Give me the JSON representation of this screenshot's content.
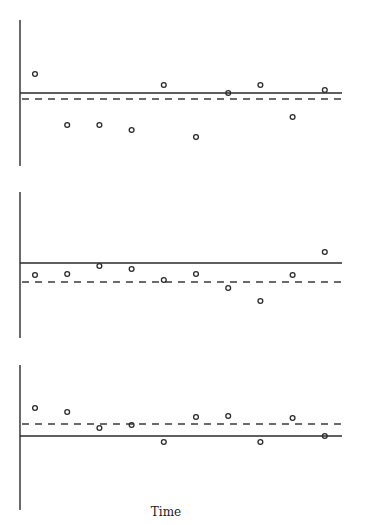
{
  "chart_data": [
    {
      "type": "scatter",
      "title": "",
      "xlabel": "",
      "ylabel": "",
      "x": [
        1,
        2,
        3,
        4,
        5,
        6,
        7,
        8,
        9,
        10
      ],
      "values": [
        19,
        -32,
        -32,
        -37,
        8,
        -44,
        0,
        8,
        -24,
        3
      ],
      "reference_lines": {
        "solid": 0,
        "dashed": -6
      },
      "ylim": [
        -73,
        73
      ],
      "grid": false,
      "legend": null
    },
    {
      "type": "scatter",
      "title": "",
      "xlabel": "",
      "ylabel": "",
      "x": [
        1,
        2,
        3,
        4,
        5,
        6,
        7,
        8,
        9,
        10
      ],
      "values": [
        -12,
        -11,
        -3,
        -6,
        -17,
        -11,
        -25,
        -38,
        -12,
        11
      ],
      "reference_lines": {
        "solid": 0,
        "dashed": -19
      },
      "ylim": [
        -75,
        71
      ],
      "grid": false,
      "legend": null
    },
    {
      "type": "scatter",
      "title": "",
      "xlabel": "Time",
      "ylabel": "",
      "x": [
        1,
        2,
        3,
        4,
        5,
        6,
        7,
        8,
        9,
        10
      ],
      "values": [
        28,
        24,
        8,
        11,
        -6,
        19,
        20,
        -6,
        18,
        0
      ],
      "reference_lines": {
        "solid": 0,
        "dashed": 12
      },
      "ylim": [
        -74,
        71
      ],
      "grid": false,
      "legend": null
    }
  ],
  "labels": {
    "xlabel": "Time"
  }
}
